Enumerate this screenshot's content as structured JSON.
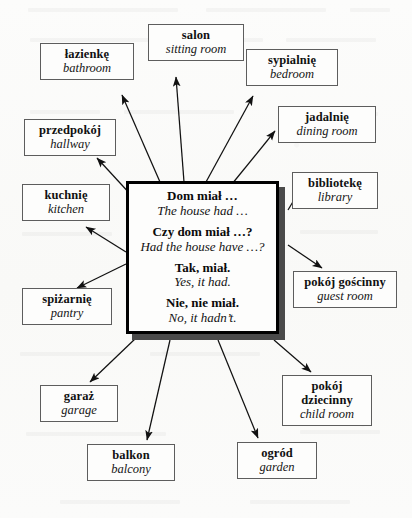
{
  "diagram": {
    "type": "hub-and-spoke vocabulary map",
    "center": {
      "name": "center-phrase-box",
      "phrases": [
        {
          "pl": "Dom miał …",
          "en": "The house had …"
        },
        {
          "pl": "Czy dom miał …?",
          "en": "Had the house have …?"
        },
        {
          "pl": "Tak, miał.",
          "en": "Yes, it had."
        },
        {
          "pl": "Nie, nie miał.",
          "en": "No, it hadn’t."
        }
      ]
    },
    "terms": [
      {
        "id": "salon",
        "pl": "salon",
        "en": "sitting room"
      },
      {
        "id": "lazienke",
        "pl": "łazienkę",
        "en": "bathroom"
      },
      {
        "id": "sypialnie",
        "pl": "sypialnię",
        "en": "bedroom"
      },
      {
        "id": "jadalnie",
        "pl": "jadalnię",
        "en": "dining room"
      },
      {
        "id": "przedpokoj",
        "pl": "przedpokój",
        "en": "hallway"
      },
      {
        "id": "biblioteke",
        "pl": "bibliotekę",
        "en": "library"
      },
      {
        "id": "kuchnie",
        "pl": "kuchnię",
        "en": "kitchen"
      },
      {
        "id": "pokoj-goscinny",
        "pl": "pokój gościnny",
        "en": "guest room"
      },
      {
        "id": "spizarnie",
        "pl": "spiżarnię",
        "en": "pantry"
      },
      {
        "id": "garaz",
        "pl": "garaż",
        "en": "garage"
      },
      {
        "id": "pokoj-dziecinny",
        "pl": "pokój dziecinny",
        "en": "child room"
      },
      {
        "id": "balkon",
        "pl": "balkon",
        "en": "balcony"
      },
      {
        "id": "ogrod",
        "pl": "ogród",
        "en": "garden"
      }
    ],
    "colors": {
      "ink": "#111111",
      "box_border": "#5d5d5d",
      "center_border": "#000000",
      "center_shadow": "#4a4a4a",
      "paper": "#fbfbfa"
    }
  }
}
